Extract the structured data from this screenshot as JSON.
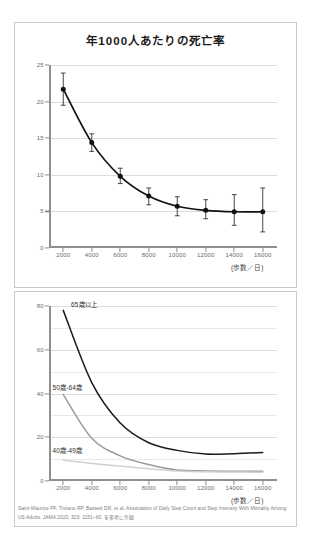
{
  "figure": {
    "footnote": "Saint-Maurice PF, Troiano RP, Bassett DR, et al. Association of Daily Step Count and Step Intensity With Mortality Among US Adults. JAMA 2020; 323: 1151–60. を参考に作図"
  },
  "chart_data": [
    {
      "type": "line",
      "title": "年1000人あたりの死亡率",
      "xlabel": "(歩数／日)",
      "ylabel": "",
      "x": [
        2000,
        4000,
        6000,
        8000,
        10000,
        12000,
        14000,
        16000
      ],
      "categories": [
        "2000",
        "4000",
        "6000",
        "8000",
        "10000",
        "12000",
        "14000",
        "16000"
      ],
      "xtick_labels": [
        "2000",
        "4000",
        "6000",
        "8000",
        "10000",
        "12000",
        "14000",
        "16000"
      ],
      "ytick_labels": [
        "0",
        "5",
        "10",
        "15",
        "20",
        "25"
      ],
      "yticks": [
        0,
        5,
        10,
        15,
        20,
        25
      ],
      "ylim": [
        0,
        25
      ],
      "xlim": [
        1000,
        17000
      ],
      "grid": true,
      "legend": "none",
      "markers": true,
      "error_bars": true,
      "series": [
        {
          "name": "死亡率",
          "color": "#111111",
          "values": [
            21.7,
            14.4,
            9.8,
            7.1,
            5.7,
            5.15,
            4.95,
            4.95
          ],
          "err_low": [
            19.5,
            13.2,
            8.8,
            5.9,
            4.4,
            4.0,
            3.1,
            2.2
          ],
          "err_high": [
            23.9,
            15.6,
            10.9,
            8.2,
            7.0,
            6.6,
            7.3,
            8.2
          ]
        }
      ]
    },
    {
      "type": "line",
      "title": "",
      "xlabel": "(歩数／日)",
      "ylabel": "",
      "x": [
        2000,
        4000,
        6000,
        8000,
        10000,
        12000,
        14000,
        16000
      ],
      "categories": [
        "2000",
        "4000",
        "6000",
        "8000",
        "10000",
        "12000",
        "14000",
        "16000"
      ],
      "xtick_labels": [
        "2000",
        "4000",
        "6000",
        "8000",
        "10000",
        "12000",
        "14000",
        "16000"
      ],
      "ytick_labels": [
        "0",
        "20",
        "40",
        "60",
        "80"
      ],
      "yticks": [
        0,
        20,
        40,
        60,
        80
      ],
      "minor_yticks": [
        10,
        30,
        50,
        70
      ],
      "ylim": [
        0,
        80
      ],
      "xlim": [
        1000,
        17000
      ],
      "grid": true,
      "legend": "inline-labels",
      "markers": false,
      "error_bars": false,
      "series": [
        {
          "name": "65歳以上",
          "label": "65歳以上",
          "color": "#1a1a1a",
          "values": [
            78.0,
            45.0,
            26.5,
            17.5,
            14.0,
            12.3,
            12.5,
            13.0
          ]
        },
        {
          "name": "50歳-64歳",
          "label": "50歳-64歳",
          "color": "#9b9b9b",
          "values": [
            39.5,
            19.5,
            11.5,
            7.5,
            5.0,
            4.6,
            4.5,
            4.5
          ]
        },
        {
          "name": "40歳-49歳",
          "label": "40歳-49歳",
          "color": "#d0d0d0",
          "values": [
            9.5,
            8.0,
            6.8,
            5.6,
            4.6,
            4.2,
            4.1,
            4.0
          ]
        }
      ]
    }
  ]
}
